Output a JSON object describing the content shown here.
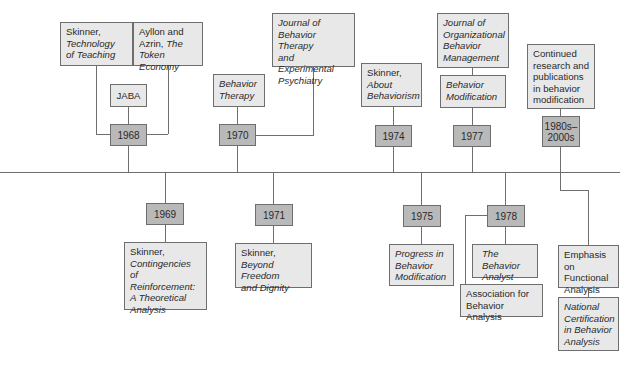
{
  "timeline": {
    "above": [
      {
        "year": "1968",
        "events": [
          {
            "lines": [
              {
                "text": "Skinner,",
                "italic": false
              },
              {
                "text": "Technology",
                "italic": true
              },
              {
                "text": "of Teaching",
                "italic": true
              }
            ]
          },
          {
            "lines": [
              {
                "text": "Ayllon and",
                "italic": false
              },
              {
                "text": "Azrin, The",
                "italic": "partial"
              },
              {
                "text": "Token Economy",
                "italic": true
              }
            ]
          },
          {
            "lines": [
              {
                "text": "JABA",
                "italic": false
              }
            ]
          }
        ]
      },
      {
        "year": "1970",
        "events": [
          {
            "lines": [
              {
                "text": "Behavior",
                "italic": true
              },
              {
                "text": "Therapy",
                "italic": true
              }
            ]
          },
          {
            "lines": [
              {
                "text": "Journal of",
                "italic": true
              },
              {
                "text": "Behavior Therapy",
                "italic": true
              },
              {
                "text": "and Experimental",
                "italic": true
              },
              {
                "text": "Psychiatry",
                "italic": true
              }
            ]
          }
        ]
      },
      {
        "year": "1974",
        "events": [
          {
            "lines": [
              {
                "text": "Skinner,",
                "italic": false
              },
              {
                "text": "About",
                "italic": true
              },
              {
                "text": "Behaviorism",
                "italic": true
              }
            ]
          }
        ]
      },
      {
        "year": "1977",
        "events": [
          {
            "lines": [
              {
                "text": "Journal of",
                "italic": true
              },
              {
                "text": "Organizational",
                "italic": true
              },
              {
                "text": "Behavior",
                "italic": true
              },
              {
                "text": "Management",
                "italic": true
              }
            ]
          },
          {
            "lines": [
              {
                "text": "Behavior",
                "italic": true
              },
              {
                "text": "Modification",
                "italic": true
              }
            ]
          }
        ]
      },
      {
        "year": "1980s–2000s",
        "year_lines": [
          "1980s–",
          "2000s"
        ],
        "events": [
          {
            "lines": [
              {
                "text": "Continued",
                "italic": false
              },
              {
                "text": "research and",
                "italic": false
              },
              {
                "text": "publications",
                "italic": false
              },
              {
                "text": "in behavior",
                "italic": false
              },
              {
                "text": "modification",
                "italic": false
              }
            ]
          }
        ]
      }
    ],
    "below": [
      {
        "year": "1969",
        "events": [
          {
            "lines": [
              {
                "text": "Skinner,",
                "italic": false
              },
              {
                "text": "Contingencies",
                "italic": true
              },
              {
                "text": "of Reinforcement:",
                "italic": true
              },
              {
                "text": "A Theoretical",
                "italic": true
              },
              {
                "text": "Analysis",
                "italic": true
              }
            ]
          }
        ]
      },
      {
        "year": "1971",
        "events": [
          {
            "lines": [
              {
                "text": "Skinner,",
                "italic": false
              },
              {
                "text": "Beyond Freedom",
                "italic": true
              },
              {
                "text": "and Dignity",
                "italic": true
              }
            ]
          }
        ]
      },
      {
        "year": "1975",
        "events": [
          {
            "lines": [
              {
                "text": "Progress in",
                "italic": true
              },
              {
                "text": "Behavior",
                "italic": true
              },
              {
                "text": "Modification",
                "italic": true
              }
            ]
          }
        ]
      },
      {
        "year": "1978",
        "events": [
          {
            "lines": [
              {
                "text": "The Behavior",
                "italic": true
              },
              {
                "text": "Analyst",
                "italic": true
              }
            ]
          },
          {
            "lines": [
              {
                "text": "Association for",
                "italic": false
              },
              {
                "text": "Behavior Analysis",
                "italic": false
              }
            ]
          }
        ]
      },
      {
        "year": "1980s–2000s",
        "events": [
          {
            "lines": [
              {
                "text": "Emphasis on",
                "italic": false
              },
              {
                "text": "Functional",
                "italic": false
              },
              {
                "text": "Analysis",
                "italic": false
              }
            ]
          },
          {
            "lines": [
              {
                "text": "National",
                "italic": true
              },
              {
                "text": "Certification",
                "italic": true
              },
              {
                "text": "in Behavior",
                "italic": true
              },
              {
                "text": "Analysis",
                "italic": true
              }
            ]
          }
        ]
      }
    ]
  },
  "labels": {
    "y1968": "1968",
    "y1969": "1969",
    "y1970": "1970",
    "y1971": "1971",
    "y1974": "1974",
    "y1975": "1975",
    "y1977": "1977",
    "y1978": "1978",
    "y1980a": "1980s–",
    "y1980b": "2000s",
    "skinner_tech": {
      "l1": "Skinner,",
      "l2": "Technology",
      "l3": "of Teaching"
    },
    "ayllon": {
      "l1": "Ayllon and",
      "l2a": "Azrin, ",
      "l2b": "The",
      "l3": "Token Economy"
    },
    "jaba": "JABA",
    "behavior_therapy": {
      "l1": "Behavior",
      "l2": "Therapy"
    },
    "jbtep": {
      "l1": "Journal of",
      "l2": "Behavior Therapy",
      "l3": "and Experimental",
      "l4": "Psychiatry"
    },
    "skinner_about": {
      "l1": "Skinner,",
      "l2": "About",
      "l3": "Behaviorism"
    },
    "jobm": {
      "l1": "Journal of",
      "l2": "Organizational",
      "l3": "Behavior",
      "l4": "Management"
    },
    "behavior_mod": {
      "l1": "Behavior",
      "l2": "Modification"
    },
    "continued": {
      "l1": "Continued",
      "l2": "research and",
      "l3": "publications",
      "l4": "in behavior",
      "l5": "modification"
    },
    "skinner_contingencies": {
      "l1": "Skinner,",
      "l2": "Contingencies",
      "l3": "of Reinforcement:",
      "l4": "A Theoretical",
      "l5": "Analysis"
    },
    "skinner_beyond": {
      "l1": "Skinner,",
      "l2": "Beyond Freedom",
      "l3": "and Dignity"
    },
    "progress": {
      "l1": "Progress in",
      "l2": "Behavior",
      "l3": "Modification"
    },
    "behavior_analyst": {
      "l1": "The Behavior",
      "l2": "Analyst"
    },
    "aba": {
      "l1": "Association for",
      "l2": "Behavior Analysis"
    },
    "emphasis": {
      "l1": "Emphasis on",
      "l2": "Functional",
      "l3": "Analysis"
    },
    "national": {
      "l1": "National",
      "l2": "Certification",
      "l3": "in Behavior",
      "l4": "Analysis"
    }
  },
  "colors": {
    "year_box": "#b9b9b9",
    "event_box": "#e8e8e8",
    "line": "#6e6e6e"
  }
}
